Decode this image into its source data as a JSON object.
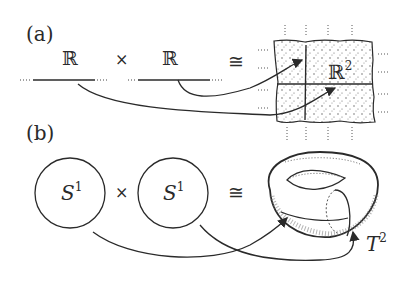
{
  "panel_a": {
    "label": "(a)",
    "left_factor": "ℝ",
    "times": "×",
    "right_factor": "ℝ",
    "iso": "≅",
    "result_base": "ℝ",
    "result_exp": "2"
  },
  "panel_b": {
    "label": "(b)",
    "left_base": "S",
    "left_exp": "1",
    "times": "×",
    "right_base": "S",
    "right_exp": "1",
    "iso": "≅",
    "result_base": "T",
    "result_exp": "2"
  }
}
